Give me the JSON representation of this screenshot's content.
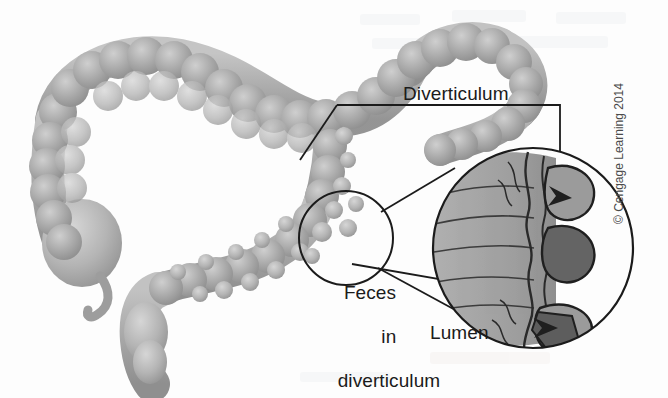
{
  "figure": {
    "background_color": "#fdfdfd",
    "ink_color": "#1b1b1b",
    "organ_fill": "#a9a9a9",
    "organ_shade": "#8d8d8d",
    "organ_highlight": "#c8c8c8",
    "pouch_fill": "#9a9a9a",
    "feces_fill": "#5d5d5d"
  },
  "labels": {
    "diverticulum": "Diverticulum",
    "feces_line1": "Feces",
    "feces_line2": "in",
    "feces_line3": "diverticulum",
    "lumen": "Lumen"
  },
  "credit": {
    "text": "© Cengage Learning 2014",
    "orientation": "vertical-rotated-90"
  },
  "anatomy": {
    "parts": [
      "ascending-colon",
      "transverse-colon",
      "descending-colon",
      "sigmoid-colon",
      "rectum",
      "cecum",
      "appendix"
    ],
    "diverticula_count_on_colon": 14,
    "haustra_segments": "beaded"
  },
  "inset": {
    "type": "magnified-cross-section",
    "center_x": 533,
    "center_y": 248,
    "radius": 101,
    "pouches": [
      {
        "name": "upper-diverticulum",
        "filled": "partial",
        "arrow": true
      },
      {
        "name": "middle-diverticulum",
        "filled": "full"
      },
      {
        "name": "lower-diverticulum",
        "filled": "partial",
        "arrow": true
      }
    ],
    "callout_circle": {
      "center_x": 346,
      "center_y": 238,
      "radius": 47
    }
  },
  "leaders": {
    "diverticulum_to_colon": true,
    "diverticulum_to_inset": true,
    "feces_to_inset": true,
    "lumen_to_inset": true
  }
}
